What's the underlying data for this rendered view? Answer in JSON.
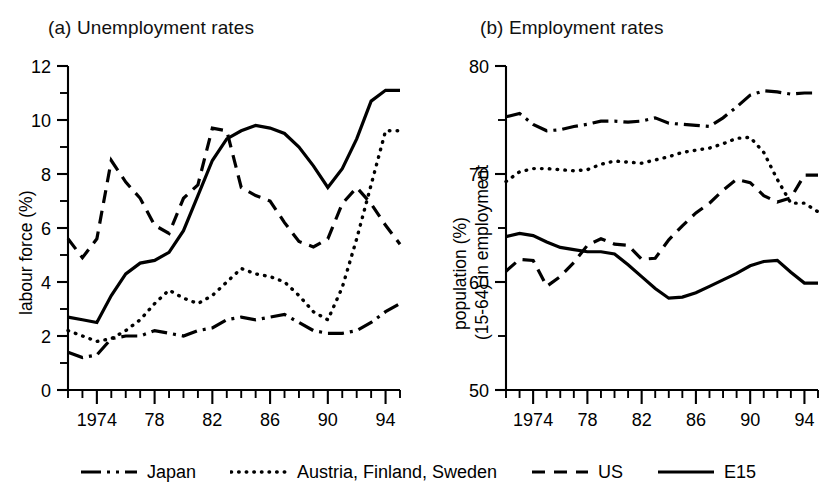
{
  "panels": {
    "a": {
      "title": "(a) Unemployment rates",
      "ylabel": "labour force (%)"
    },
    "b": {
      "title": "(b) Employment rates",
      "ylabel_line1": "population (%)",
      "ylabel_line2": "(15-64) in employment"
    }
  },
  "legend": {
    "items": [
      {
        "label": "Japan",
        "style": "dashdot",
        "name": "legend-item-japan"
      },
      {
        "label": "Austria, Finland, Sweden",
        "style": "dotted",
        "name": "legend-item-austria-finland-sweden"
      },
      {
        "label": "US",
        "style": "dashed",
        "name": "legend-item-us"
      },
      {
        "label": "E15",
        "style": "solid",
        "name": "legend-item-e15"
      }
    ]
  },
  "chart_data": [
    {
      "id": "unemployment",
      "type": "line",
      "title": "(a) Unemployment rates",
      "xlabel": "",
      "ylabel": "labour force (%)",
      "xlim": [
        1972,
        1995
      ],
      "ylim": [
        0,
        12
      ],
      "yticks": [
        0,
        2,
        4,
        6,
        8,
        10,
        12
      ],
      "yticks_minor": [
        1,
        3,
        5,
        7,
        9,
        11
      ],
      "xticks_major": [
        1974,
        1978,
        1982,
        1986,
        1990,
        1994
      ],
      "xtick_labels": [
        "1974",
        "78",
        "82",
        "86",
        "90",
        "94"
      ],
      "xticks_minor_step": 1,
      "grid": false,
      "legend_position": "bottom",
      "x": [
        1972,
        1973,
        1974,
        1975,
        1976,
        1977,
        1978,
        1979,
        1980,
        1981,
        1982,
        1983,
        1984,
        1985,
        1986,
        1987,
        1988,
        1989,
        1990,
        1991,
        1992,
        1993,
        1994,
        1995
      ],
      "series": [
        {
          "name": "Japan",
          "style": "dashdot",
          "values": [
            1.4,
            1.2,
            1.3,
            1.9,
            2.0,
            2.0,
            2.2,
            2.1,
            2.0,
            2.2,
            2.3,
            2.6,
            2.7,
            2.6,
            2.7,
            2.8,
            2.5,
            2.2,
            2.1,
            2.1,
            2.2,
            2.5,
            2.9,
            3.2
          ]
        },
        {
          "name": "Austria, Finland, Sweden",
          "style": "dotted",
          "values": [
            2.2,
            2.0,
            1.8,
            1.9,
            2.2,
            2.6,
            3.2,
            3.7,
            3.4,
            3.2,
            3.5,
            4.0,
            4.5,
            4.3,
            4.2,
            4.0,
            3.5,
            2.9,
            2.6,
            3.8,
            5.6,
            7.6,
            9.6,
            9.6
          ]
        },
        {
          "name": "US",
          "style": "dashed",
          "values": [
            5.6,
            4.9,
            5.6,
            8.5,
            7.7,
            7.1,
            6.1,
            5.8,
            7.1,
            7.6,
            9.7,
            9.6,
            7.5,
            7.2,
            7.0,
            6.2,
            5.5,
            5.3,
            5.6,
            6.9,
            7.5,
            6.9,
            6.1,
            5.4
          ]
        },
        {
          "name": "E15",
          "style": "solid",
          "values": [
            2.7,
            2.6,
            2.5,
            3.5,
            4.3,
            4.7,
            4.8,
            5.1,
            5.9,
            7.2,
            8.5,
            9.3,
            9.6,
            9.8,
            9.7,
            9.5,
            9.0,
            8.3,
            7.5,
            8.2,
            9.3,
            10.7,
            11.1,
            11.1
          ]
        }
      ]
    },
    {
      "id": "employment",
      "type": "line",
      "title": "(b) Employment rates",
      "xlabel": "",
      "ylabel": "population (%) (15-64) in employment",
      "xlim": [
        1972,
        1995
      ],
      "ylim": [
        50,
        80
      ],
      "yticks": [
        50,
        60,
        70,
        80
      ],
      "yticks_minor": [
        55,
        65,
        75
      ],
      "xticks_major": [
        1974,
        1978,
        1982,
        1986,
        1990,
        1994
      ],
      "xtick_labels": [
        "1974",
        "78",
        "82",
        "86",
        "90",
        "94"
      ],
      "xticks_minor_step": 1,
      "grid": false,
      "legend_position": "bottom",
      "x": [
        1972,
        1973,
        1974,
        1975,
        1976,
        1977,
        1978,
        1979,
        1980,
        1981,
        1982,
        1983,
        1984,
        1985,
        1986,
        1987,
        1988,
        1989,
        1990,
        1991,
        1992,
        1993,
        1994,
        1995
      ],
      "series": [
        {
          "name": "Japan",
          "style": "dashdot",
          "values": [
            75.3,
            75.6,
            74.6,
            74.0,
            74.1,
            74.4,
            74.6,
            74.9,
            74.9,
            74.8,
            74.9,
            75.2,
            74.7,
            74.6,
            74.5,
            74.4,
            75.2,
            76.2,
            77.3,
            77.7,
            77.6,
            77.4,
            77.5,
            77.5
          ]
        },
        {
          "name": "Austria, Finland, Sweden",
          "style": "dotted",
          "values": [
            69.3,
            70.2,
            70.5,
            70.5,
            70.4,
            70.3,
            70.4,
            70.9,
            71.2,
            71.1,
            71.0,
            71.3,
            71.6,
            72.0,
            72.2,
            72.4,
            72.8,
            73.3,
            73.4,
            72.0,
            69.5,
            67.3,
            67.3,
            66.5
          ]
        },
        {
          "name": "US",
          "style": "dashed",
          "values": [
            61.0,
            62.1,
            62.0,
            59.6,
            60.5,
            61.8,
            63.4,
            64.0,
            63.5,
            63.4,
            62.1,
            62.2,
            63.9,
            65.2,
            66.4,
            67.3,
            68.5,
            69.5,
            69.2,
            68.0,
            67.4,
            67.8,
            69.9,
            69.9
          ]
        },
        {
          "name": "E15",
          "style": "solid",
          "values": [
            64.2,
            64.5,
            64.3,
            63.7,
            63.2,
            63.0,
            62.8,
            62.8,
            62.6,
            61.6,
            60.5,
            59.4,
            58.5,
            58.6,
            59.0,
            59.6,
            60.2,
            60.8,
            61.5,
            61.9,
            62.0,
            60.9,
            59.9,
            59.9
          ]
        }
      ]
    }
  ]
}
